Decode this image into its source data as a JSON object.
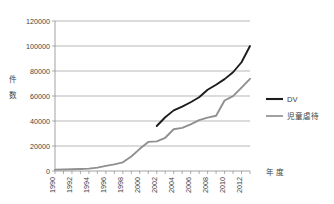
{
  "chart_data": {
    "type": "line",
    "title": "",
    "xlabel": "年 度",
    "ylabel": "件 数",
    "ylim": [
      0,
      120000
    ],
    "xlim": [
      1990,
      2013
    ],
    "grid": true,
    "legend_position": "right",
    "y_ticks": [
      "0",
      "20000",
      "40000",
      "60000",
      "80000",
      "100000",
      "120000"
    ],
    "y_tick_values": [
      0,
      20000,
      40000,
      60000,
      80000,
      100000,
      120000
    ],
    "x_tick_labels": [
      "1990",
      "1992",
      "1994",
      "1996",
      "1998",
      "2000",
      "2002",
      "2004",
      "2006",
      "2008",
      "2010",
      "2012"
    ],
    "x_tick_values": [
      1990,
      1992,
      1994,
      1996,
      1998,
      2000,
      2002,
      2004,
      2006,
      2008,
      2010,
      2012
    ],
    "x_minor_ticks": [
      1990,
      1991,
      1992,
      1993,
      1994,
      1995,
      1996,
      1997,
      1998,
      1999,
      2000,
      2001,
      2002,
      2003,
      2004,
      2005,
      2006,
      2007,
      2008,
      2009,
      2010,
      2011,
      2012,
      2013
    ],
    "series": [
      {
        "name": "DV",
        "color": "#1c1c1c",
        "width": 1.9,
        "x": [
          2002,
          2003,
          2004,
          2005,
          2006,
          2007,
          2008,
          2009,
          2010,
          2011,
          2012,
          2013
        ],
        "values": [
          36000,
          43000,
          48500,
          51500,
          55000,
          59000,
          65000,
          69000,
          73500,
          79000,
          87000,
          100000
        ]
      },
      {
        "name": "児童虐待",
        "color": "#909090",
        "width": 1.9,
        "x": [
          1990,
          1991,
          1992,
          1993,
          1994,
          1995,
          1996,
          1997,
          1998,
          1999,
          2000,
          2001,
          2002,
          2003,
          2004,
          2005,
          2006,
          2007,
          2008,
          2009,
          2010,
          2011,
          2012,
          2013
        ],
        "values": [
          1100,
          1200,
          1400,
          1600,
          1900,
          2700,
          4100,
          5350,
          6930,
          11630,
          17725,
          23274,
          23738,
          26569,
          33408,
          34472,
          37323,
          40639,
          42664,
          44211,
          56384,
          59919,
          66701,
          73765
        ]
      }
    ]
  },
  "legend": {
    "items": [
      {
        "label": "DV",
        "color": "#1c1c1c"
      },
      {
        "label": "児童虐待",
        "color": "#909090"
      }
    ]
  },
  "axes": {
    "y_title": "件 数",
    "y_title_chars": [
      "件",
      "数"
    ],
    "x_title": "年 度"
  }
}
